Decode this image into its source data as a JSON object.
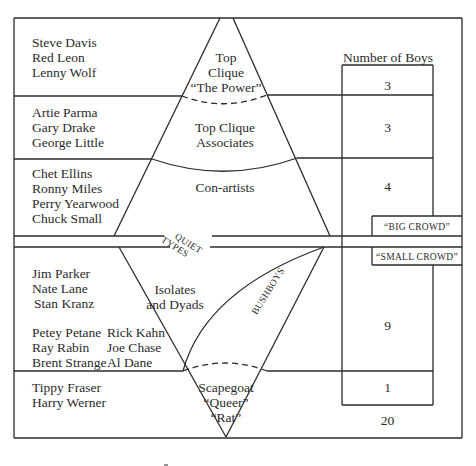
{
  "diagram": {
    "header": {
      "number_of_boys_label": "Number of Boys"
    },
    "strata": [
      {
        "id": "top-clique",
        "names": [
          "Steve Davis",
          "Red Leon",
          "Lenny Wolf"
        ],
        "label_lines": [
          "Top",
          "Clique",
          "“The Power”"
        ],
        "count": "3"
      },
      {
        "id": "top-clique-associates",
        "names": [
          "Artie Parma",
          "Gary Drake",
          "George Little"
        ],
        "label_lines": [
          "Top Clique",
          "Associates"
        ],
        "count": "3"
      },
      {
        "id": "con-artists",
        "names": [
          "Chet Ellins",
          "Ronny Miles",
          "Perry Yearwood",
          "Chuck Small"
        ],
        "label_lines": [
          "Con-artists"
        ],
        "count": "4"
      },
      {
        "id": "isolates-and-dyads",
        "names": [
          "Jim Parker",
          "Nate Lane",
          "Stan Kranz"
        ],
        "names_col1": [
          "Petey Petane",
          "Ray Rabin",
          "Brent Strange"
        ],
        "names_col2": [
          "Rick Kahn",
          "Joe Chase",
          "Al Dane"
        ],
        "label_lines": [
          "Isolates",
          "and Dyads"
        ],
        "count": "9"
      },
      {
        "id": "scapegoat",
        "names": [
          "Tippy Fraser",
          "Harry Werner"
        ],
        "label_lines": [
          "Scapegoat",
          "“Queer”",
          "“Rat”"
        ],
        "count": "1"
      }
    ],
    "side_labels": {
      "quiet_types_line1": "QUIET",
      "quiet_types_line2": "TYPES",
      "bushboys": "BUSHBOYS",
      "big_crowd": "“BIG CROWD”",
      "small_crowd": "“SMALL CROWD”"
    },
    "total": "20",
    "colors": {
      "line": "#2b2b2b",
      "background": "#ffffff"
    }
  }
}
